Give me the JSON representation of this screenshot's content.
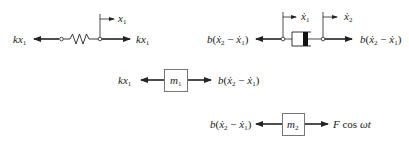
{
  "diagram": {
    "type": "free-body-diagram",
    "colors": {
      "line": "#222222",
      "box_stroke": "#666666",
      "piston": "#111111",
      "background": "#ffffff"
    },
    "spring_element": {
      "left_force": {
        "coef": "k",
        "var": "x",
        "sub": "1"
      },
      "right_force": {
        "coef": "k",
        "var": "x",
        "sub": "1"
      },
      "displacement": {
        "var": "x",
        "sub": "1"
      }
    },
    "damper_element": {
      "left_force": {
        "coef": "b",
        "open": "(",
        "a": "ẋ",
        "asub": "2",
        "minus": " − ",
        "b": "ẋ",
        "bsub": "1",
        "close": ")"
      },
      "right_force": {
        "coef": "b",
        "open": "(",
        "a": "ẋ",
        "asub": "2",
        "minus": " − ",
        "b": "ẋ",
        "bsub": "1",
        "close": ")"
      },
      "velocity_left": {
        "var": "ẋ",
        "sub": "1"
      },
      "velocity_right": {
        "var": "ẋ",
        "sub": "2"
      }
    },
    "mass_1": {
      "label": {
        "var": "m",
        "sub": "1"
      },
      "left_force": {
        "coef": "k",
        "var": "x",
        "sub": "1"
      },
      "right_force": {
        "coef": "b",
        "open": "(",
        "a": "ẋ",
        "asub": "2",
        "minus": " − ",
        "b": "ẋ",
        "bsub": "1",
        "close": ")"
      }
    },
    "mass_2": {
      "label": {
        "var": "m",
        "sub": "2"
      },
      "left_force": {
        "coef": "b",
        "open": "(",
        "a": "ẋ",
        "asub": "2",
        "minus": " − ",
        "b": "ẋ",
        "bsub": "1",
        "close": ")"
      },
      "right_force": {
        "F": "F",
        "cos": " cos ",
        "omega_t": "ωt"
      }
    }
  }
}
